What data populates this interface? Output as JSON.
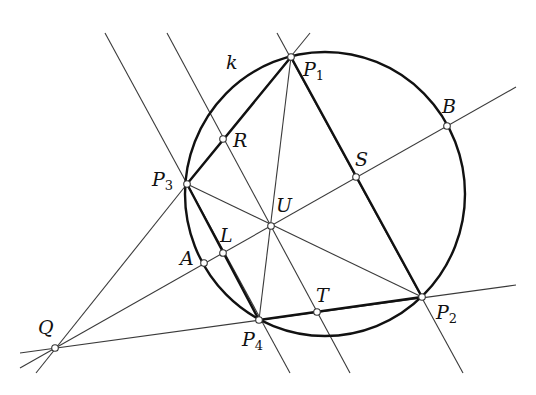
{
  "diagram": {
    "type": "geometry-construction",
    "circle": {
      "label": "k",
      "cx": 325,
      "cy": 194,
      "rx": 140,
      "ry": 142
    },
    "points": [
      {
        "id": "P1",
        "name": "P",
        "sub": "1",
        "x": 291,
        "y": 57,
        "lx": 303,
        "ly": 60
      },
      {
        "id": "P2",
        "name": "P",
        "sub": "2",
        "x": 422,
        "y": 297,
        "lx": 436,
        "ly": 303
      },
      {
        "id": "P3",
        "name": "P",
        "sub": "3",
        "x": 187,
        "y": 184,
        "lx": 152,
        "ly": 170
      },
      {
        "id": "P4",
        "name": "P",
        "sub": "4",
        "x": 259,
        "y": 320,
        "lx": 242,
        "ly": 330
      },
      {
        "id": "R",
        "name": "R",
        "sub": "",
        "x": 223,
        "y": 139,
        "lx": 233,
        "ly": 131
      },
      {
        "id": "S",
        "name": "S",
        "sub": "",
        "x": 356,
        "y": 177,
        "lx": 355,
        "ly": 150
      },
      {
        "id": "B",
        "name": "B",
        "sub": "",
        "x": 447,
        "y": 126,
        "lx": 442,
        "ly": 97
      },
      {
        "id": "U",
        "name": "U",
        "sub": "",
        "x": 271,
        "y": 226,
        "lx": 276,
        "ly": 196
      },
      {
        "id": "L",
        "name": "L",
        "sub": "",
        "x": 223,
        "y": 253,
        "lx": 220,
        "ly": 226
      },
      {
        "id": "A",
        "name": "A",
        "sub": "",
        "x": 204,
        "y": 263,
        "lx": 180,
        "ly": 249
      },
      {
        "id": "T",
        "name": "T",
        "sub": "",
        "x": 317,
        "y": 312,
        "lx": 316,
        "ly": 286
      },
      {
        "id": "Q",
        "name": "Q",
        "sub": "",
        "x": 55,
        "y": 348,
        "lx": 38,
        "ly": 318
      }
    ],
    "circle_label": {
      "text": "k",
      "x": 226,
      "y": 53
    },
    "thin_lines": [
      {
        "from": [
          105,
          33
        ],
        "to": [
          290,
          373
        ]
      },
      {
        "from": [
          167,
          33
        ],
        "to": [
          350,
          373
        ]
      },
      {
        "from": [
          277,
          33
        ],
        "to": [
          463,
          373
        ]
      },
      {
        "from": [
          310,
          33
        ],
        "to": [
          187,
          184
        ]
      },
      {
        "from": [
          291,
          57
        ],
        "to": [
          259,
          320
        ]
      },
      {
        "from": [
          36,
          373
        ],
        "to": [
          187,
          184
        ]
      },
      {
        "from": [
          20,
          368
        ],
        "to": [
          516,
          87
        ]
      },
      {
        "from": [
          20,
          353
        ],
        "to": [
          516,
          285
        ]
      },
      {
        "from": [
          187,
          184
        ],
        "to": [
          422,
          297
        ]
      }
    ],
    "thick_segments": [
      {
        "from": "P1",
        "to": "P3"
      },
      {
        "from": "P1",
        "to": "P2"
      },
      {
        "from": "P3",
        "to": "P4"
      },
      {
        "from": "P4",
        "to": "P2"
      }
    ]
  }
}
